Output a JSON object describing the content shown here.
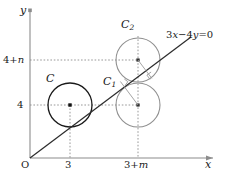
{
  "figure": {
    "background_color": "#ffffff",
    "width": 227,
    "height": 175
  },
  "axes": {
    "x_axis_label": "x",
    "y_axis_label": "y",
    "origin_label": "O",
    "axis_color": "#8c8c8c",
    "origin_px": {
      "x": 30,
      "y": 158
    },
    "x_axis_end_px": {
      "x": 215,
      "y": 158
    },
    "y_axis_top_px": {
      "x": 30,
      "y": 10
    }
  },
  "ticks": {
    "x": [
      {
        "label": "3",
        "label_parts": {
          "base": "3"
        },
        "px": 70
      },
      {
        "label": "3+m",
        "label_parts": {
          "base": "3+",
          "var": "m"
        },
        "px": 138
      }
    ],
    "y": [
      {
        "label": "4",
        "label_parts": {
          "base": "4"
        },
        "px": 105
      },
      {
        "label": "4+n",
        "label_parts": {
          "base": "4+",
          "var": "n"
        },
        "px": 60
      }
    ]
  },
  "line": {
    "equation": "3x-4y=0",
    "equation_parts": {
      "a": "3",
      "x": "x",
      "minus": "−",
      "b": "4",
      "y": "y",
      "eq": "=0"
    },
    "color": "#2b2b2b",
    "from_px": {
      "x": 30,
      "y": 158
    },
    "to_px": {
      "x": 191,
      "y": 37
    },
    "slope": 0.75
  },
  "circles": [
    {
      "name": "C",
      "label": "C",
      "label_parts": {
        "base": "C",
        "sub": ""
      },
      "center_px": {
        "x": 70,
        "y": 105
      },
      "radius_px": 22,
      "stroke": "#1a1a1a",
      "stroke_width": 1.3,
      "center_dot": true,
      "center_math": {
        "x": "3",
        "y": "4"
      }
    },
    {
      "name": "C1",
      "label": "C",
      "label_parts": {
        "base": "C",
        "sub": "1"
      },
      "center_px": {
        "x": 138,
        "y": 105
      },
      "radius_px": 22,
      "stroke": "#8f8f8f",
      "stroke_width": 1.1,
      "center_dot": true,
      "center_math": {
        "x": "3+m",
        "y": "4"
      }
    },
    {
      "name": "C2",
      "label": "C",
      "label_parts": {
        "base": "C",
        "sub": "2"
      },
      "center_px": {
        "x": 138,
        "y": 60
      },
      "radius_px": 22,
      "stroke": "#8f8f8f",
      "stroke_width": 1.1,
      "center_dot": true,
      "center_math": {
        "x": "3+m",
        "y": "4+n"
      }
    }
  ],
  "perpendiculars": [
    {
      "from": "C1",
      "from_px": {
        "x": 138,
        "y": 105
      },
      "to_px": {
        "x": 120,
        "y": 81
      },
      "color": "#9a9a9a",
      "right_angle_mark": true
    },
    {
      "from": "C2",
      "from_px": {
        "x": 138,
        "y": 60
      },
      "to_px": {
        "x": 152,
        "y": 78
      },
      "color": "#9a9a9a",
      "right_angle_mark": true
    }
  ],
  "guides": {
    "color": "#8c8c8c",
    "dash": "1.6 1.8"
  }
}
